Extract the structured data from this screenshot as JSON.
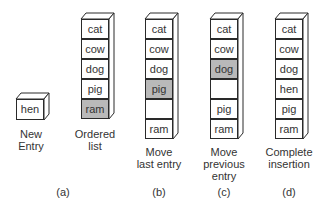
{
  "figure": {
    "new_entry": {
      "value": "hen",
      "caption": [
        "New",
        "Entry"
      ]
    },
    "panels": [
      {
        "id": "a",
        "letter": "(a)",
        "caption": [
          "Ordered",
          "list"
        ],
        "cells": [
          {
            "text": "cat",
            "highlight": false
          },
          {
            "text": "cow",
            "highlight": false
          },
          {
            "text": "dog",
            "highlight": false
          },
          {
            "text": "pig",
            "highlight": false
          },
          {
            "text": "ram",
            "highlight": true
          }
        ]
      },
      {
        "id": "b",
        "letter": "(b)",
        "caption": [
          "Move",
          "last entry"
        ],
        "cells": [
          {
            "text": "cat",
            "highlight": false
          },
          {
            "text": "cow",
            "highlight": false
          },
          {
            "text": "dog",
            "highlight": false
          },
          {
            "text": "pig",
            "highlight": true
          },
          {
            "text": "",
            "highlight": false
          },
          {
            "text": "ram",
            "highlight": false
          }
        ]
      },
      {
        "id": "c",
        "letter": "(c)",
        "caption": [
          "Move",
          "previous",
          "entry"
        ],
        "cells": [
          {
            "text": "cat",
            "highlight": false
          },
          {
            "text": "cow",
            "highlight": false
          },
          {
            "text": "dog",
            "highlight": true
          },
          {
            "text": "",
            "highlight": false
          },
          {
            "text": "pig",
            "highlight": false
          },
          {
            "text": "ram",
            "highlight": false
          }
        ]
      },
      {
        "id": "d",
        "letter": "(d)",
        "caption": [
          "Complete",
          "insertion"
        ],
        "cells": [
          {
            "text": "cat",
            "highlight": false
          },
          {
            "text": "cow",
            "highlight": false
          },
          {
            "text": "dog",
            "highlight": false
          },
          {
            "text": "hen",
            "highlight": false
          },
          {
            "text": "pig",
            "highlight": false
          },
          {
            "text": "ram",
            "highlight": false
          }
        ]
      }
    ],
    "colors": {
      "highlight": "#b9b9b9",
      "stroke": "#2a2a2a",
      "text": "#333333"
    }
  }
}
